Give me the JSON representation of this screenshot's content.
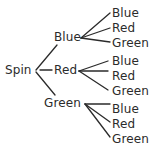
{
  "diagram": {
    "type": "probability-tree-diagram",
    "title": "Spin",
    "stroke_color": "#2b2b2b",
    "text_color": "#2b2b2b",
    "background_color": "#ffffff",
    "root": {
      "label": "Spin",
      "x": 5,
      "y": 64
    },
    "stage1": [
      {
        "label": "Blue",
        "x": 54,
        "y": 31,
        "fork_x": 81,
        "fork_y": 38
      },
      {
        "label": "Red",
        "x": 54,
        "y": 64,
        "fork_x": 79,
        "fork_y": 71
      },
      {
        "label": "Green",
        "x": 44,
        "y": 97,
        "fork_x": 85,
        "fork_y": 104
      }
    ],
    "stage2": [
      {
        "label": "Blue",
        "x": 112,
        "y": 7,
        "parent": 0
      },
      {
        "label": "Red",
        "x": 112,
        "y": 22,
        "parent": 0
      },
      {
        "label": "Green",
        "x": 112,
        "y": 37,
        "parent": 0
      },
      {
        "label": "Blue",
        "x": 112,
        "y": 55,
        "parent": 1
      },
      {
        "label": "Red",
        "x": 112,
        "y": 70,
        "parent": 1
      },
      {
        "label": "Green",
        "x": 112,
        "y": 85,
        "parent": 1
      },
      {
        "label": "Blue",
        "x": 112,
        "y": 103,
        "parent": 2
      },
      {
        "label": "Red",
        "x": 112,
        "y": 118,
        "parent": 2
      },
      {
        "label": "Green",
        "x": 112,
        "y": 133,
        "parent": 2
      }
    ],
    "branches_stage1": [
      {
        "from_x": 36,
        "from_y": 70,
        "to_x": 57,
        "to_y": 45
      },
      {
        "from_x": 40,
        "from_y": 70,
        "to_x": 52,
        "to_y": 70
      },
      {
        "from_x": 36,
        "from_y": 72,
        "to_x": 55,
        "to_y": 95
      }
    ],
    "branches_stage2": [
      {
        "from_x": 81,
        "from_y": 38,
        "to_x": 110,
        "to_y": 13
      },
      {
        "from_x": 81,
        "from_y": 38,
        "to_x": 110,
        "to_y": 28
      },
      {
        "from_x": 81,
        "from_y": 38,
        "to_x": 110,
        "to_y": 42
      },
      {
        "from_x": 79,
        "from_y": 71,
        "to_x": 108,
        "to_y": 61
      },
      {
        "from_x": 79,
        "from_y": 71,
        "to_x": 108,
        "to_y": 71
      },
      {
        "from_x": 79,
        "from_y": 71,
        "to_x": 108,
        "to_y": 90
      },
      {
        "from_x": 85,
        "from_y": 104,
        "to_x": 110,
        "to_y": 104
      },
      {
        "from_x": 85,
        "from_y": 104,
        "to_x": 110,
        "to_y": 122
      },
      {
        "from_x": 85,
        "from_y": 104,
        "to_x": 110,
        "to_y": 137
      }
    ]
  }
}
